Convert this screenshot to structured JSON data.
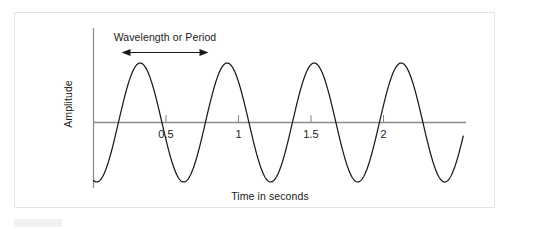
{
  "figure": {
    "background_color": "#ffffff",
    "border_color": "#e4e4e4",
    "curve_color": "#1a1a1a",
    "axis_color": "#888888",
    "text_color": "#1a1a1a"
  },
  "annotation": {
    "label": "Wavelength or Period",
    "arrow_style": "double-headed",
    "x_start": 0.0,
    "x_end": 0.6
  },
  "chart_data": {
    "type": "line",
    "title": "",
    "subtitle": "",
    "xlabel": "Time in seconds",
    "ylabel": "Amplitude",
    "xlim": [
      -0.02,
      2.6
    ],
    "ylim": [
      -1.15,
      1.15
    ],
    "grid": false,
    "legend": null,
    "x_ticks": [
      0.5,
      1,
      1.5,
      2
    ],
    "x_tick_labels": [
      "0.5",
      "1",
      "1.5",
      "2"
    ],
    "y_ticks": [],
    "y_tick_labels": [],
    "series": [
      {
        "name": "sine wave",
        "waveform": "sine",
        "amplitude": 1.0,
        "period": 0.6,
        "frequency": 1.667,
        "phase": -1.8,
        "cycles": 4.2,
        "x_start": 0.0,
        "x_end": 2.55,
        "peaks_x": [
          0.22,
          0.82,
          1.32,
          1.83
        ],
        "troughs_x": [
          0.57,
          1.07,
          1.58,
          2.08
        ]
      }
    ],
    "annotations": [
      {
        "text": "Wavelength or Period",
        "x": 0.39,
        "y": 1.0,
        "type": "span-arrow"
      }
    ]
  }
}
